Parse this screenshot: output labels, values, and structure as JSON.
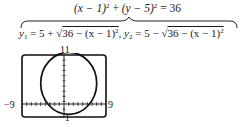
{
  "equation": {
    "top": {
      "lhs_a": "(x − 1)",
      "exp_a": "2",
      "plus": " + ",
      "lhs_b": "(y − 5)",
      "exp_b": "2",
      "rhs": " = 36"
    },
    "y1": {
      "name": "y",
      "sub": "1",
      "prefix": " = 5 + √",
      "radicand": "36 − (x − 1)",
      "exp": "2",
      "sep": ",  "
    },
    "y2": {
      "name": "y",
      "sub": "2",
      "prefix": " = 5 − √",
      "radicand": "36 − (x − 1)",
      "exp": "2"
    }
  },
  "graph": {
    "ymax_label": "11",
    "ymin_label": "−1",
    "xmin_label": "−9",
    "xmax_label": "9",
    "window": {
      "xmin": -9,
      "xmax": 9,
      "ymin": -1,
      "ymax": 11
    },
    "circle": {
      "center_x": 1,
      "center_y": 5,
      "radius": 6
    }
  }
}
